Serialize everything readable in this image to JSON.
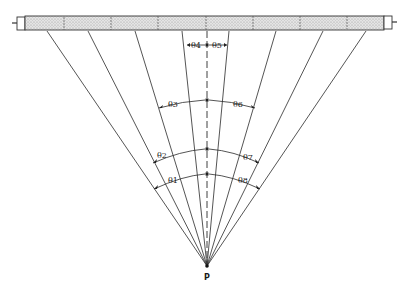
{
  "diagram": {
    "type": "geometry-figure",
    "point_label": "P",
    "angle_labels": [
      "θ1",
      "θ2",
      "θ3",
      "θ4",
      "θ5",
      "θ6",
      "θ7",
      "θ8"
    ],
    "colors": {
      "line": "#2a2a2a",
      "tube_fill": "#d8d8d8",
      "background": "#ffffff"
    },
    "tube": {
      "x_start": 17,
      "x_end": 392,
      "y_top": 15,
      "y_bottom": 30,
      "segment_count": 8
    },
    "point_P": {
      "x": 207,
      "y": 266
    },
    "ray_endpoints_x": [
      47,
      88,
      135,
      182,
      229,
      276,
      323,
      366
    ]
  }
}
